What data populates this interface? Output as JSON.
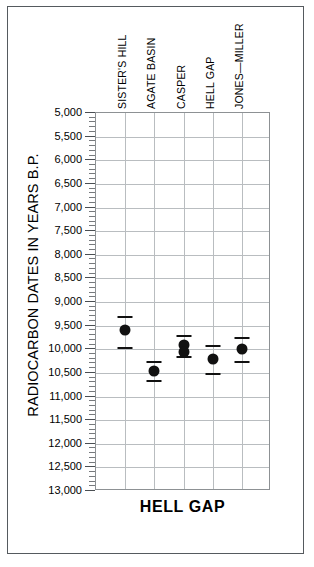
{
  "figure": {
    "title": "HELL GAP",
    "ylabel": "RADIOCARBON DATES IN YEARS B.P."
  },
  "chart_data": {
    "type": "scatter",
    "title": "HELL GAP",
    "xlabel": "",
    "ylabel": "RADIOCARBON DATES IN YEARS B.P.",
    "ylim": [
      5000,
      13000
    ],
    "y_inverted": true,
    "grid": true,
    "legend": "none",
    "y_major_step": 500,
    "y_minor_step": 100,
    "categories": [
      "SISTER'S HILL",
      "AGATE BASIN",
      "CASPER",
      "HELL GAP",
      "JONES—MILLER"
    ],
    "ytick_labels": [
      "5,000",
      "5,500",
      "6,000",
      "6,500",
      "7,000",
      "7,500",
      "8,000",
      "8,500",
      "9,000",
      "9,500",
      "10,000",
      "10,500",
      "11,000",
      "11,500",
      "12,000",
      "12,500",
      "13,000"
    ],
    "series": [
      {
        "name": "Radiocarbon dates",
        "points": [
          {
            "category": "SISTER'S HILL",
            "x": 1,
            "value": 9600,
            "low": 9300,
            "high": 9950
          },
          {
            "category": "AGATE BASIN",
            "x": 2,
            "value": 10450,
            "low": 10250,
            "high": 10650
          },
          {
            "category": "CASPER",
            "x": 3,
            "value": 9900,
            "low": 9700,
            "high": 10150
          },
          {
            "category": "CASPER",
            "x": 3,
            "value": 10050,
            "low": 9700,
            "high": 10150
          },
          {
            "category": "HELL GAP",
            "x": 4,
            "value": 10200,
            "low": 9900,
            "high": 10500
          },
          {
            "category": "JONES—MILLER",
            "x": 5,
            "value": 10000,
            "low": 9750,
            "high": 10250
          }
        ]
      }
    ]
  }
}
